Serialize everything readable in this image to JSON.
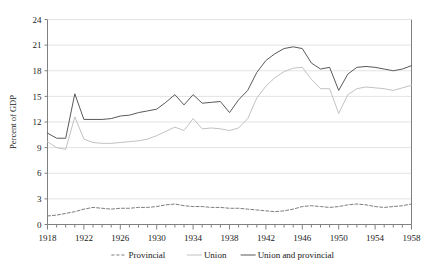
{
  "chart_data": {
    "type": "line",
    "title": "",
    "xlabel": "",
    "ylabel": "Percent of GDP",
    "xlim": [
      1918,
      1958
    ],
    "ylim": [
      0,
      24
    ],
    "yticks": [
      0,
      3,
      6,
      9,
      12,
      15,
      18,
      21,
      24
    ],
    "xticks_labeled": [
      1918,
      1922,
      1926,
      1930,
      1934,
      1938,
      1942,
      1946,
      1950,
      1954,
      1958
    ],
    "xtick_step_minor": 1,
    "grid": "horizontal",
    "legend_position": "bottom",
    "x": [
      1918,
      1919,
      1920,
      1921,
      1922,
      1923,
      1924,
      1925,
      1926,
      1927,
      1928,
      1929,
      1930,
      1931,
      1932,
      1933,
      1934,
      1935,
      1936,
      1937,
      1938,
      1939,
      1940,
      1941,
      1942,
      1943,
      1944,
      1945,
      1946,
      1947,
      1948,
      1949,
      1950,
      1951,
      1952,
      1953,
      1954,
      1955,
      1956,
      1957,
      1958
    ],
    "series": [
      {
        "name": "Provincial",
        "style": "dashed",
        "color": "#7d7d7d",
        "values": [
          1.0,
          1.1,
          1.3,
          1.5,
          1.8,
          2.0,
          1.9,
          1.8,
          1.9,
          1.9,
          2.0,
          2.0,
          2.1,
          2.3,
          2.4,
          2.2,
          2.1,
          2.1,
          2.0,
          2.0,
          1.9,
          1.9,
          1.8,
          1.7,
          1.6,
          1.5,
          1.6,
          1.8,
          2.1,
          2.2,
          2.1,
          2.0,
          2.1,
          2.3,
          2.4,
          2.3,
          2.1,
          2.0,
          2.1,
          2.2,
          2.4
        ]
      },
      {
        "name": "Union",
        "style": "solid",
        "color": "#c2c2c2",
        "values": [
          9.7,
          9.0,
          8.8,
          12.6,
          10.0,
          9.6,
          9.5,
          9.5,
          9.6,
          9.7,
          9.8,
          10.0,
          10.4,
          10.9,
          11.4,
          11.0,
          12.4,
          11.2,
          11.3,
          11.2,
          11.0,
          11.3,
          12.4,
          14.8,
          16.2,
          17.2,
          17.9,
          18.3,
          18.4,
          17.0,
          15.9,
          15.9,
          13.0,
          15.2,
          15.9,
          16.1,
          16.0,
          15.9,
          15.7,
          16.0,
          16.3
        ]
      },
      {
        "name": "Union and provincial",
        "style": "solid",
        "color": "#595959",
        "values": [
          10.7,
          10.1,
          10.1,
          15.3,
          12.3,
          12.3,
          12.3,
          12.4,
          12.7,
          12.8,
          13.1,
          13.3,
          13.5,
          14.3,
          15.2,
          14.0,
          15.2,
          14.2,
          14.3,
          14.4,
          13.1,
          14.6,
          15.7,
          17.8,
          19.2,
          20.0,
          20.6,
          20.8,
          20.6,
          18.9,
          18.2,
          18.4,
          15.7,
          17.6,
          18.4,
          18.5,
          18.4,
          18.2,
          18.0,
          18.2,
          18.6
        ]
      }
    ],
    "legend": [
      {
        "label": "Provincial",
        "style": "dashed",
        "color": "#7d7d7d"
      },
      {
        "label": "Union",
        "style": "solid",
        "color": "#c2c2c2"
      },
      {
        "label": "Union and provincial",
        "style": "solid",
        "color": "#595959"
      }
    ]
  },
  "colors": {
    "background": "#ffffff",
    "axis": "#808080",
    "gridline": "#e3e3e3",
    "text": "#1a1a1a"
  }
}
